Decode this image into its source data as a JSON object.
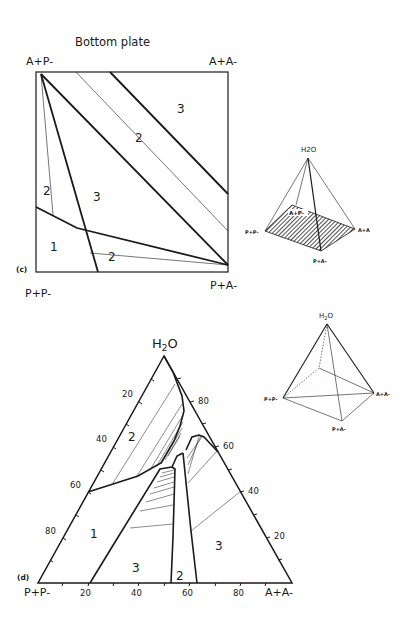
{
  "panel_c": {
    "title": "Bottom plate",
    "panel_label": "(c)",
    "corners": {
      "top_left": "A+P-",
      "top_right": "A+A-",
      "bottom_left": "P+P-",
      "bottom_right": "P+A-"
    },
    "region_labels": [
      "3",
      "2",
      "2",
      "3",
      "1",
      "2"
    ],
    "inset": {
      "apex": "H2O",
      "apex_sub": "2",
      "vertices": [
        "A+P-",
        "P+P-",
        "A+A",
        "P+A-"
      ]
    }
  },
  "panel_d": {
    "panel_label": "(d)",
    "apex": "H2O",
    "apex_sub": "2",
    "bottom_left": "P+P-",
    "bottom_right": "A+A-",
    "left_axis_ticks": [
      "20",
      "40",
      "60",
      "80"
    ],
    "right_axis_ticks": [
      "80",
      "60",
      "40",
      "20"
    ],
    "bottom_axis_ticks": [
      "20",
      "40",
      "60",
      "80"
    ],
    "region_labels": [
      "2",
      "1",
      "3",
      "2",
      "3"
    ],
    "inset": {
      "apex": "H2O",
      "apex_sub": "2",
      "vertices": [
        "P+P-",
        "A+A-",
        "P+A-"
      ]
    }
  }
}
